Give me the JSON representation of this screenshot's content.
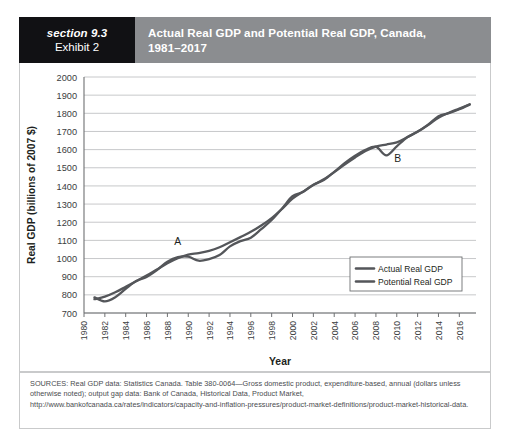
{
  "header": {
    "section_label": "section 9.3",
    "exhibit_label": "Exhibit 2",
    "title_line1": "Actual Real GDP and Potential Real GDP, Canada,",
    "title_line2": "1981–2017",
    "left_bg": "#111114",
    "right_bg": "#8b8d90"
  },
  "sources": {
    "text": "SOURCES: Real GDP data: Statistics Canada. Table 380-0064—Gross domestic product, expenditure-based, annual (dollars unless otherwise noted); output gap data: Bank of Canada, Historical Data, Product Market, http://www.bankofcanada.ca/rates/indicators/capacity-and-inflation-pressures/product-market-definitions/product-market-historical-data."
  },
  "chart_data": {
    "type": "line",
    "title": "Actual Real GDP and Potential Real GDP, Canada, 1981–2017",
    "xlabel": "Year",
    "ylabel": "Real GDP (billions of 2007 $)",
    "xlim": [
      1980,
      2017.6
    ],
    "ylim": [
      700,
      2000
    ],
    "ytick_step": 100,
    "xtick_step": 2,
    "grid": "horizontal",
    "legend_position": "inside-bottom-right",
    "yticks": [
      700,
      800,
      900,
      1000,
      1100,
      1200,
      1300,
      1400,
      1500,
      1600,
      1700,
      1800,
      1900,
      2000
    ],
    "xticks": [
      1980,
      1982,
      1984,
      1986,
      1988,
      1990,
      1992,
      1994,
      1996,
      1998,
      2000,
      2002,
      2004,
      2006,
      2008,
      2010,
      2012,
      2014,
      2016
    ],
    "line_color": "#54565a",
    "series": [
      {
        "name": "Actual Real GDP",
        "color": "#54565a",
        "x": [
          1981,
          1982,
          1983,
          1984,
          1985,
          1986,
          1987,
          1988,
          1989,
          1990,
          1991,
          1992,
          1993,
          1994,
          1995,
          1996,
          1997,
          1998,
          1999,
          2000,
          2001,
          2002,
          2003,
          2004,
          2005,
          2006,
          2007,
          2008,
          2009,
          2010,
          2011,
          2012,
          2013,
          2014,
          2015,
          2016,
          2017
        ],
        "values": [
          786,
          764,
          787,
          833,
          876,
          899,
          937,
          983,
          1008,
          1010,
          988,
          997,
          1019,
          1067,
          1096,
          1115,
          1162,
          1212,
          1276,
          1343,
          1367,
          1406,
          1432,
          1477,
          1525,
          1566,
          1599,
          1616,
          1568,
          1618,
          1668,
          1698,
          1737,
          1784,
          1801,
          1822,
          1848
        ]
      },
      {
        "name": "Potential Real GDP",
        "color": "#54565a",
        "x": [
          1981,
          1982,
          1983,
          1984,
          1985,
          1986,
          1987,
          1988,
          1989,
          1990,
          1991,
          1992,
          1993,
          1994,
          1995,
          1996,
          1997,
          1998,
          1999,
          2000,
          2001,
          2002,
          2003,
          2004,
          2005,
          2006,
          2007,
          2008,
          2009,
          2010,
          2011,
          2012,
          2013,
          2014,
          2015,
          2016,
          2017
        ],
        "values": [
          776,
          790,
          814,
          844,
          875,
          906,
          940,
          974,
          1002,
          1022,
          1030,
          1042,
          1062,
          1090,
          1118,
          1147,
          1182,
          1223,
          1274,
          1330,
          1368,
          1405,
          1437,
          1476,
          1518,
          1557,
          1592,
          1617,
          1628,
          1640,
          1668,
          1700,
          1735,
          1775,
          1803,
          1826,
          1850
        ]
      }
    ],
    "annotations": [
      {
        "label": "A",
        "x": 1989,
        "y": 1075,
        "note": "peak above potential, late 1980s"
      },
      {
        "label": "B",
        "x": 2010.1,
        "y": 1530,
        "note": "trough below potential, 2009 recession"
      }
    ],
    "legend": [
      {
        "label": "Actual Real GDP",
        "color": "#54565a"
      },
      {
        "label": "Potential Real GDP",
        "color": "#54565a"
      }
    ]
  }
}
